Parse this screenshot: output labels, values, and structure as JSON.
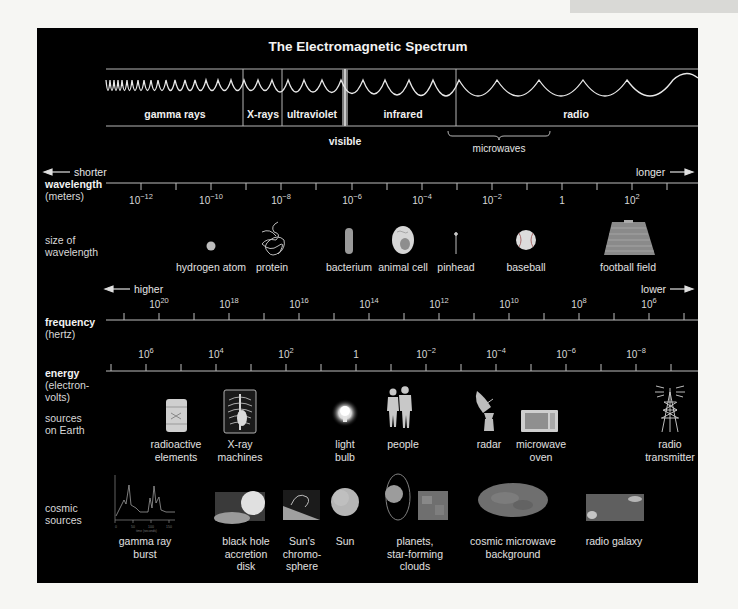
{
  "title": "The Electromagnetic Spectrum",
  "bands": [
    {
      "label": "gamma rays",
      "x": 175
    },
    {
      "label": "X-rays",
      "x": 263
    },
    {
      "label": "ultraviolet",
      "x": 312
    },
    {
      "label": "infrared",
      "x": 403
    },
    {
      "label": "radio",
      "x": 576
    }
  ],
  "visible_label": "visible",
  "microwaves_label": "microwaves",
  "wavelength": {
    "name": "wavelength",
    "unit": "(meters)",
    "shorter": "shorter",
    "longer": "longer",
    "ticks": [
      {
        "base": "10",
        "exp": "−12",
        "x": 141
      },
      {
        "base": "10",
        "exp": "−10",
        "x": 211
      },
      {
        "base": "10",
        "exp": "−8",
        "x": 281
      },
      {
        "base": "10",
        "exp": "−6",
        "x": 352
      },
      {
        "base": "10",
        "exp": "−4",
        "x": 422
      },
      {
        "base": "10",
        "exp": "−2",
        "x": 492
      },
      {
        "base": "1",
        "exp": "",
        "x": 562
      },
      {
        "base": "10",
        "exp": "2",
        "x": 632
      }
    ]
  },
  "size_of_wavelength": {
    "name_line1": "size of",
    "name_line2": "wavelength",
    "items": [
      {
        "label": "hydrogen atom",
        "icon": "hydrogen-atom-icon",
        "x": 211
      },
      {
        "label": "protein",
        "icon": "protein-icon",
        "x": 272
      },
      {
        "label": "bacterium",
        "icon": "bacterium-icon",
        "x": 349
      },
      {
        "label": "animal cell",
        "icon": "animal-cell-icon",
        "x": 403
      },
      {
        "label": "pinhead",
        "icon": "pinhead-icon",
        "x": 456
      },
      {
        "label": "baseball",
        "icon": "baseball-icon",
        "x": 526
      },
      {
        "label": "football field",
        "icon": "football-field-icon",
        "x": 628
      }
    ]
  },
  "frequency": {
    "name": "frequency",
    "unit": "(hertz)",
    "higher": "higher",
    "lower": "lower",
    "ticks": [
      {
        "base": "10",
        "exp": "20",
        "x": 159
      },
      {
        "base": "10",
        "exp": "18",
        "x": 229
      },
      {
        "base": "10",
        "exp": "16",
        "x": 299
      },
      {
        "base": "10",
        "exp": "14",
        "x": 369
      },
      {
        "base": "10",
        "exp": "12",
        "x": 439
      },
      {
        "base": "10",
        "exp": "10",
        "x": 509
      },
      {
        "base": "10",
        "exp": "8",
        "x": 579
      },
      {
        "base": "10",
        "exp": "6",
        "x": 649
      }
    ]
  },
  "energy": {
    "name": "energy",
    "unit_line1": "(electron-",
    "unit_line2": "volts)",
    "ticks": [
      {
        "base": "10",
        "exp": "6",
        "x": 146
      },
      {
        "base": "10",
        "exp": "4",
        "x": 216
      },
      {
        "base": "10",
        "exp": "2",
        "x": 286
      },
      {
        "base": "1",
        "exp": "",
        "x": 356
      },
      {
        "base": "10",
        "exp": "−2",
        "x": 426
      },
      {
        "base": "10",
        "exp": "−4",
        "x": 496
      },
      {
        "base": "10",
        "exp": "−6",
        "x": 566
      },
      {
        "base": "10",
        "exp": "−8",
        "x": 636
      }
    ]
  },
  "sources_on_earth": {
    "name_line1": "sources",
    "name_line2": "on Earth",
    "items": [
      {
        "line1": "radioactive",
        "line2": "elements",
        "icon": "radioactive-barrel-icon",
        "x": 176
      },
      {
        "line1": "X-ray",
        "line2": "machines",
        "icon": "xray-machine-icon",
        "x": 240
      },
      {
        "line1": "light",
        "line2": "bulb",
        "icon": "light-bulb-icon",
        "x": 345
      },
      {
        "line1": "people",
        "line2": "",
        "icon": "people-icon",
        "x": 403
      },
      {
        "line1": "radar",
        "line2": "",
        "icon": "radar-dish-icon",
        "x": 489
      },
      {
        "line1": "microwave",
        "line2": "oven",
        "icon": "microwave-oven-icon",
        "x": 541
      },
      {
        "line1": "radio",
        "line2": "transmitter",
        "icon": "radio-transmitter-icon",
        "x": 670
      }
    ]
  },
  "cosmic_sources": {
    "name_line1": "cosmic",
    "name_line2": "sources",
    "items": [
      {
        "line1": "gamma ray",
        "line2": "burst",
        "line3": "",
        "icon": "gamma-ray-burst-plot-icon",
        "x": 145
      },
      {
        "line1": "black hole",
        "line2": "accretion",
        "line3": "disk",
        "icon": "black-hole-accretion-disk-icon",
        "x": 246
      },
      {
        "line1": "Sun's",
        "line2": "chromo-",
        "line3": "sphere",
        "icon": "sun-chromosphere-icon",
        "x": 302
      },
      {
        "line1": "Sun",
        "line2": "",
        "line3": "",
        "icon": "sun-icon",
        "x": 345
      },
      {
        "line1": "planets,",
        "line2": "star-forming",
        "line3": "clouds",
        "icon": "planets-clouds-icon",
        "x": 415
      },
      {
        "line1": "cosmic microwave",
        "line2": "background",
        "line3": "",
        "icon": "cmb-map-icon",
        "x": 513
      },
      {
        "line1": "radio galaxy",
        "line2": "",
        "line3": "",
        "icon": "radio-galaxy-icon",
        "x": 614
      }
    ]
  },
  "gamma_burst_plot": {
    "x_ticks": [
      "0",
      "50",
      "100",
      "150"
    ],
    "x_label": "time (seconds)",
    "y_label": "gamma-ray intensity"
  },
  "colors": {
    "background": "#f6f6f3",
    "panel": "#000000",
    "text": "#e6e6e6",
    "line": "#bdbdbd"
  }
}
